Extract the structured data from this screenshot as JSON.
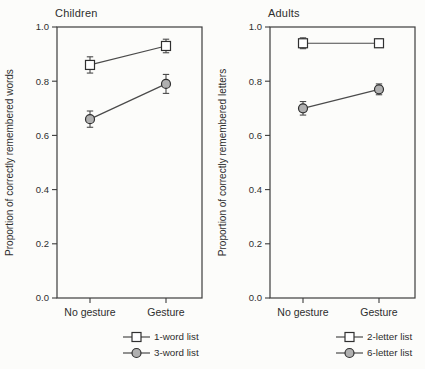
{
  "figure": {
    "background": "#fcfcfa",
    "colors": {
      "axis": "#3c3c3c",
      "line": "#4a4a4a",
      "text": "#2e2e2e",
      "square_fill": "#ffffff",
      "circle_fill": "#b0b0b0",
      "marker_stroke": "#303030"
    }
  },
  "chart_data": [
    {
      "type": "line",
      "title": "Children",
      "ylabel": "Proportion of correctly remembered words",
      "xlabel": "",
      "categories": [
        "No gesture",
        "Gesture"
      ],
      "ylim": [
        0.0,
        1.0
      ],
      "yticks": [
        0.0,
        0.2,
        0.4,
        0.6,
        0.8,
        1.0
      ],
      "grid": false,
      "legend_position": "bottom-right",
      "series": [
        {
          "name": "1-word list",
          "marker": "square",
          "values": [
            0.86,
            0.93
          ],
          "errors": [
            0.03,
            0.025
          ]
        },
        {
          "name": "3-word list",
          "marker": "circle",
          "values": [
            0.66,
            0.79
          ],
          "errors": [
            0.03,
            0.035
          ]
        }
      ]
    },
    {
      "type": "line",
      "title": "Adults",
      "ylabel": "Proportion of correctly remembered letters",
      "xlabel": "",
      "categories": [
        "No gesture",
        "Gesture"
      ],
      "ylim": [
        0.0,
        1.0
      ],
      "yticks": [
        0.0,
        0.2,
        0.4,
        0.6,
        0.8,
        1.0
      ],
      "grid": false,
      "legend_position": "bottom-right",
      "series": [
        {
          "name": "2-letter list",
          "marker": "square",
          "values": [
            0.94,
            0.94
          ],
          "errors": [
            0.02,
            0.015
          ]
        },
        {
          "name": "6-letter list",
          "marker": "circle",
          "values": [
            0.7,
            0.77
          ],
          "errors": [
            0.025,
            0.02
          ]
        }
      ]
    }
  ]
}
